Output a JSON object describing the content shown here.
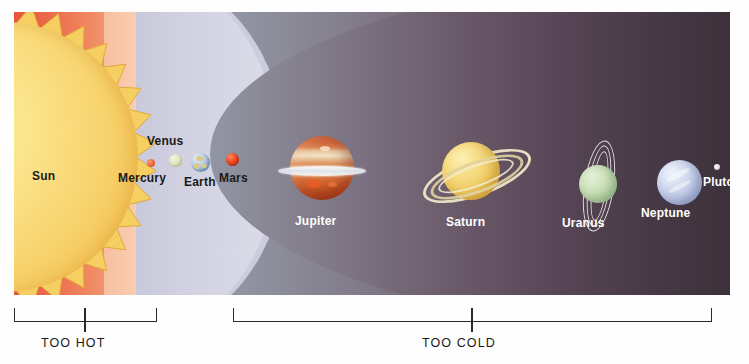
{
  "diagram": {
    "type": "solar-system-scale-illustration"
  },
  "zones": [
    {
      "id": "hot",
      "label": "",
      "color": "#ea6246",
      "description": "inner hot region near the Sun"
    },
    {
      "id": "habitable",
      "label": "",
      "color": "#d2d2e2",
      "description": "pale lavender band containing Earth"
    },
    {
      "id": "cold",
      "label": "",
      "color": "#6b5a69",
      "description": "outer cold region"
    }
  ],
  "bodies": [
    {
      "name": "Sun",
      "label": "Sun",
      "label_color": "#1a1a1a",
      "color": "#f8d571"
    },
    {
      "name": "Mercury",
      "label": "Mercury",
      "label_color": "#1a1a1a",
      "color": "#ef6a42"
    },
    {
      "name": "Venus",
      "label": "Venus",
      "label_color": "#1a1a1a",
      "color": "#e2e6bf"
    },
    {
      "name": "Earth",
      "label": "Earth",
      "label_color": "#1a1a1a",
      "color": "#8fb2d4"
    },
    {
      "name": "Mars",
      "label": "Mars",
      "label_color": "#1a1a1a",
      "color": "#ef4a22"
    },
    {
      "name": "Jupiter",
      "label": "Jupiter",
      "label_color": "#ffffff",
      "color": "#d9713d"
    },
    {
      "name": "Saturn",
      "label": "Saturn",
      "label_color": "#ffffff",
      "color": "#f0cc63"
    },
    {
      "name": "Uranus",
      "label": "Uranus",
      "label_color": "#ffffff",
      "color": "#b6d2a4"
    },
    {
      "name": "Neptune",
      "label": "Neptune",
      "label_color": "#ffffff",
      "color": "#bdc7e6"
    },
    {
      "name": "Pluto",
      "label": "Pluto",
      "label_color": "#ffffff",
      "color": "#dcdcdc"
    }
  ],
  "brackets": [
    {
      "id": "too-hot",
      "label": "TOO HOT"
    },
    {
      "id": "too-cold",
      "label": "TOO COLD"
    }
  ]
}
